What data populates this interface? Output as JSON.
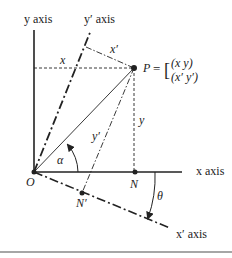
{
  "diagram": {
    "labels": {
      "y_axis": "y axis",
      "y_prime_axis": "y′ axis",
      "x_axis": "x axis",
      "x_prime_axis": "x′ axis",
      "origin": "O",
      "point_P": "P",
      "point_N": "N",
      "point_N_prime": "N′",
      "x_coord": "x",
      "y_coord": "y",
      "x_prime_coord": "x′",
      "y_prime_coord": "y′",
      "alpha": "α",
      "theta": "θ",
      "P_equals": "= [",
      "P_row1": "(x  y)",
      "P_row2": "(x′  y′)"
    },
    "colors": {
      "ink": "#222222",
      "background": "#ffffff",
      "rule": "#888888"
    },
    "points": {
      "O": [
        34,
        172
      ],
      "P": [
        134,
        68
      ],
      "N": [
        135,
        172
      ],
      "N_prime": [
        82,
        193
      ]
    }
  }
}
